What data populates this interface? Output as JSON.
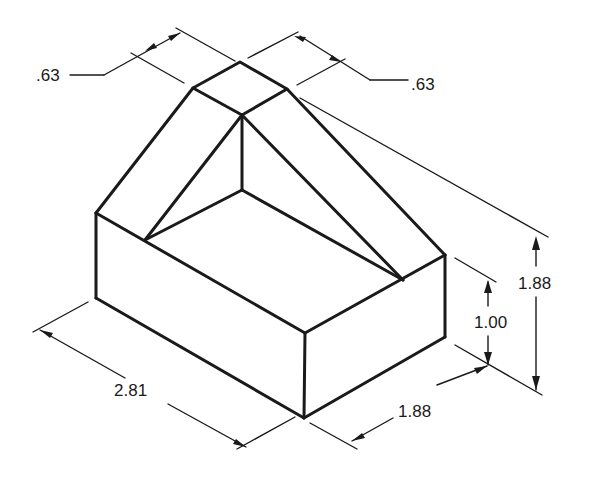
{
  "drawing": {
    "type": "isometric technical drawing",
    "subject": "rectangular block with hollow and triangular ridge",
    "dimensions": {
      "top_width_left": ".63",
      "top_width_right": ".63",
      "overall_height": "1.88",
      "base_height": "1.00",
      "length": "2.81",
      "depth": "1.88"
    }
  }
}
